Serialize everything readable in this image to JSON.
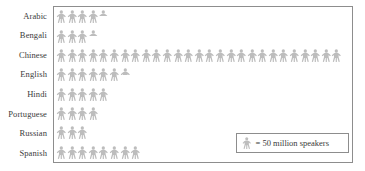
{
  "chart_data": {
    "type": "bar",
    "subtype": "pictograph",
    "title": "",
    "xlabel": "",
    "ylabel": "",
    "unit_label": "= 50 million speakers",
    "unit_value": 50,
    "unit_name": "million speakers",
    "icon": "person-icon",
    "icon_color": "#bdbdbd",
    "frame_color": "#8d8d8d",
    "grid": false,
    "legend_position": "bottom-right",
    "categories": [
      "Arabic",
      "Bengali",
      "Chinese",
      "English",
      "Hindi",
      "Portuguese",
      "Russian",
      "Spanish"
    ],
    "icon_counts": [
      4.5,
      3.5,
      27,
      6.5,
      5,
      4,
      3,
      8
    ],
    "values": [
      225,
      175,
      1350,
      325,
      250,
      200,
      150,
      400
    ]
  },
  "rows": [
    {
      "label": "Arabic",
      "full": 4,
      "half": true,
      "icons": 4.5,
      "value": 225
    },
    {
      "label": "Bengali",
      "full": 3,
      "half": true,
      "icons": 3.5,
      "value": 175
    },
    {
      "label": "Chinese",
      "full": 27,
      "half": false,
      "icons": 27,
      "value": 1350
    },
    {
      "label": "English",
      "full": 6,
      "half": true,
      "icons": 6.5,
      "value": 325
    },
    {
      "label": "Hindi",
      "full": 5,
      "half": false,
      "icons": 5,
      "value": 250
    },
    {
      "label": "Portuguese",
      "full": 4,
      "half": false,
      "icons": 4,
      "value": 200
    },
    {
      "label": "Russian",
      "full": 3,
      "half": false,
      "icons": 3,
      "value": 150
    },
    {
      "label": "Spanish",
      "full": 8,
      "half": false,
      "icons": 8,
      "value": 400
    }
  ],
  "legend": {
    "text": "= 50 million speakers"
  }
}
